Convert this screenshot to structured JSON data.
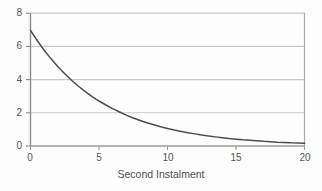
{
  "chart_data": {
    "type": "line",
    "title": "",
    "subtitle": "",
    "xlabel": "Second Instalment",
    "ylabel": "",
    "xlim": [
      0,
      20
    ],
    "ylim": [
      0,
      8
    ],
    "xticks": [
      "0",
      "5",
      "10",
      "15",
      "20"
    ],
    "xtick_values": [
      0,
      5,
      10,
      15,
      20
    ],
    "yticks": [
      "0",
      "2",
      "4",
      "6",
      "8"
    ],
    "ytick_values": [
      0,
      2,
      4,
      6,
      8
    ],
    "grid": "horizontal",
    "legend": "none",
    "series": [
      {
        "name": "decay-curve",
        "color": "#4d4d4d",
        "x": [
          0,
          0.5,
          1,
          1.5,
          2,
          2.5,
          3,
          3.5,
          4,
          4.5,
          5,
          5.5,
          6,
          6.5,
          7,
          7.5,
          8,
          8.5,
          9,
          9.5,
          10,
          10.5,
          11,
          11.5,
          12,
          12.5,
          13,
          13.5,
          14,
          14.5,
          15,
          15.5,
          16,
          16.5,
          17,
          17.5,
          18,
          18.5,
          19,
          19.5,
          20
        ],
        "values": [
          6.97,
          6.34,
          5.77,
          5.25,
          4.78,
          4.35,
          3.96,
          3.6,
          3.28,
          2.98,
          2.71,
          2.47,
          2.25,
          2.05,
          1.86,
          1.69,
          1.54,
          1.4,
          1.28,
          1.16,
          1.06,
          0.96,
          0.88,
          0.8,
          0.73,
          0.66,
          0.6,
          0.55,
          0.5,
          0.45,
          0.41,
          0.37,
          0.34,
          0.31,
          0.28,
          0.26,
          0.23,
          0.21,
          0.19,
          0.18,
          0.16
        ]
      }
    ],
    "colors": {
      "curve": "#4d4d4d",
      "grid": "#c9c9c9",
      "axis": "#8a8a8a",
      "background": "#fdfdfd",
      "text": "#555555"
    }
  },
  "axes": {
    "y_labels": [
      {
        "text": "8",
        "top": 8
      },
      {
        "text": "6",
        "top": 41
      },
      {
        "text": "4",
        "top": 75
      },
      {
        "text": "2",
        "top": 108
      },
      {
        "text": "0",
        "top": 141
      }
    ],
    "x_labels": [
      {
        "text": "0",
        "left": 18
      },
      {
        "text": "5",
        "left": 87
      },
      {
        "text": "10",
        "left": 156
      },
      {
        "text": "15",
        "left": 224
      },
      {
        "text": "20",
        "left": 293
      }
    ],
    "x_title": "Second Instalment"
  }
}
